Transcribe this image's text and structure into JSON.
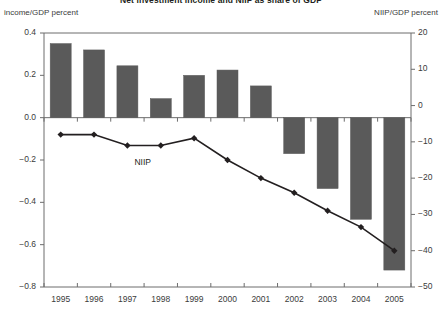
{
  "chart_data": {
    "type": "bar",
    "title": "Net investment income and NIIP as share of GDP",
    "xlabel": "",
    "ylabel_left": "income/GDP percent",
    "ylabel_right": "NIIP/GDP percent",
    "grid": false,
    "legend_position": "inline-annotation",
    "categories": [
      "1995",
      "1996",
      "1997",
      "1998",
      "1999",
      "2000",
      "2001",
      "2002",
      "2003",
      "2004",
      "2005"
    ],
    "left_axis": {
      "label": "income/GDP percent",
      "ylim": [
        -0.8,
        0.4
      ],
      "ticks": [
        "0.4",
        "0.2",
        "0.0",
        "−0.2",
        "−0.4",
        "−0.6",
        "−0.8"
      ],
      "tick_values": [
        0.4,
        0.2,
        0.0,
        -0.2,
        -0.4,
        -0.6,
        -0.8
      ]
    },
    "right_axis": {
      "label": "NIIP/GDP percent",
      "ylim": [
        -50,
        20
      ],
      "ticks": [
        "20",
        "10",
        "0",
        "−10",
        "−20",
        "−30",
        "−40",
        "−50"
      ],
      "tick_values": [
        20,
        10,
        0,
        -10,
        -20,
        -30,
        -40,
        -50
      ]
    },
    "series": [
      {
        "name": "Net investment income / GDP",
        "type": "bar",
        "axis": "left",
        "color": "#5a5a5a",
        "values": [
          0.35,
          0.32,
          0.245,
          0.09,
          0.2,
          0.225,
          0.15,
          -0.17,
          -0.335,
          -0.48,
          -0.72
        ]
      },
      {
        "name": "NIIP",
        "type": "line",
        "axis": "right",
        "color": "#231f20",
        "annotation": "NIIP",
        "values": [
          -8.0,
          -8.0,
          -11.0,
          -11.0,
          -9.0,
          -15.0,
          -20.0,
          -24.0,
          -29.0,
          -33.5,
          -40.0
        ]
      }
    ],
    "annotations": [
      {
        "text": "NIIP",
        "x": "1997.3",
        "y": "-13"
      }
    ]
  }
}
